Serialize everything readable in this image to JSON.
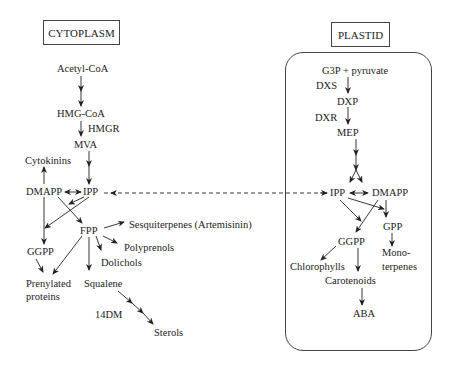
{
  "compartments": {
    "cytoplasm": "CYTOPLASM",
    "plastid": "PLASTID"
  },
  "cytoplasm": {
    "acetyl_coa": "Acetyl-CoA",
    "hmg_coa": "HMG-CoA",
    "hmgr": "HMGR",
    "mva": "MVA",
    "cytokinins": "Cytokinins",
    "dmapp": "DMAPP",
    "ipp": "IPP",
    "fpp": "FPP",
    "sesquiterpenes": "Sesquiterpenes (Artemisinin)",
    "polyprenols": "Polyprenols",
    "dolichols": "Dolichols",
    "ggpp": "GGPP",
    "prenylated_1": "Prenylated",
    "prenylated_2": "proteins",
    "squalene": "Squalene",
    "dm14": "14DM",
    "sterols": "Sterols"
  },
  "plastid": {
    "g3p": "G3P + pyruvate",
    "dxs": "DXS",
    "dxp": "DXP",
    "dxr": "DXR",
    "mep": "MEP",
    "ipp": "IPP",
    "dmapp": "DMAPP",
    "gpp": "GPP",
    "ggpp": "GGPP",
    "mono_1": "Mono-",
    "mono_2": "terpenes",
    "chlorophylls": "Chlorophylls",
    "carotenoids": "Carotenoids",
    "aba": "ABA"
  },
  "colors": {
    "line": "#222222",
    "border": "#444444"
  }
}
